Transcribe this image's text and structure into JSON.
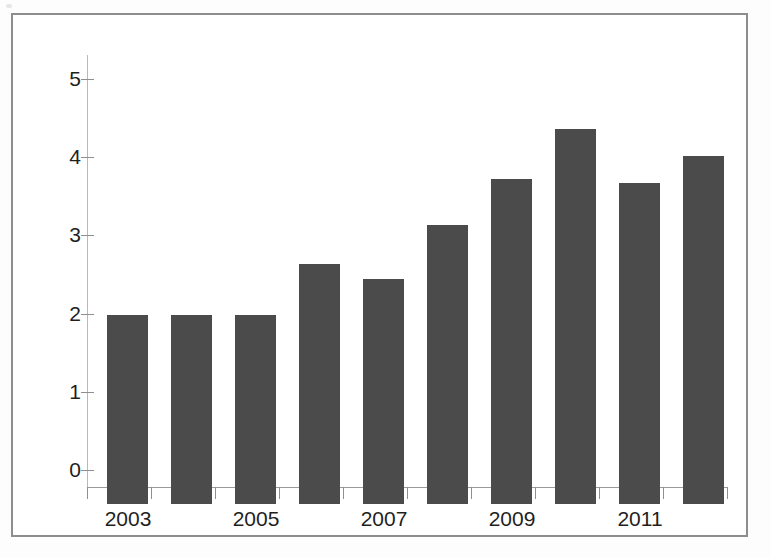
{
  "chart_data": {
    "type": "bar",
    "title": "",
    "subtitle": "",
    "xlabel": "",
    "ylabel": "",
    "categories": [
      "2003",
      "2004",
      "2005",
      "2006",
      "2007",
      "2008",
      "2009",
      "2010",
      "2011",
      "2012"
    ],
    "values": [
      2.42,
      2.42,
      2.42,
      3.07,
      2.88,
      3.57,
      4.16,
      4.79,
      4.1,
      4.45
    ],
    "series": [
      {
        "name": "",
        "values": [
          2.42,
          2.42,
          2.42,
          3.07,
          2.88,
          3.57,
          4.16,
          4.79,
          4.1,
          4.45
        ]
      }
    ],
    "ylim": [
      0,
      5
    ],
    "y_ticks": [
      0,
      1,
      2,
      3,
      4,
      5
    ],
    "y_tick_labels": [
      "0",
      "1",
      "2",
      "3",
      "4",
      "5"
    ],
    "x_tick_labels": [
      "2003",
      "",
      "2005",
      "",
      "2007",
      "",
      "2009",
      "",
      "2011",
      ""
    ],
    "x_tick_labels_visible": [
      "2003",
      "2005",
      "2007",
      "2009",
      "2011"
    ],
    "grid": false,
    "legend": null,
    "legend_position": "none",
    "bar_color": "#4b4b4b",
    "axis_color": "#8f8f8f",
    "background_color": "#ffffff",
    "annotations": []
  },
  "figure": {
    "frame_border_color": "#8d8d8d",
    "page_background": "#fdfdfd"
  }
}
